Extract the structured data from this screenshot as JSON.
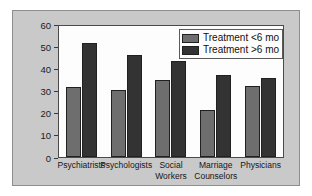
{
  "chart_data": {
    "type": "bar",
    "title": "",
    "subtitle": "",
    "xlabel": "",
    "ylabel": "",
    "ylim": [
      0,
      60
    ],
    "yticks": [
      0,
      10,
      20,
      30,
      40,
      50,
      60
    ],
    "ytick_labels": [
      "0",
      "10",
      "20",
      "30",
      "40",
      "50",
      "60"
    ],
    "grid": false,
    "legend_position": "top-right",
    "categories": [
      "Psychiatrists",
      "Psychologists",
      "Social Workers",
      "Marriage Counselors",
      "Physicians"
    ],
    "category_lines": [
      [
        "Psychiatrists"
      ],
      [
        "Psychologists"
      ],
      [
        "Social",
        "Workers"
      ],
      [
        "Marriage",
        "Counselors"
      ],
      [
        "Physicians"
      ]
    ],
    "series": [
      {
        "name": "Treatment <6 mo",
        "color": "#6e6e6e",
        "values": [
          32,
          30.8,
          35.5,
          21.5,
          32.5
        ]
      },
      {
        "name": "Treatment >6 mo",
        "color": "#333333",
        "values": [
          52.3,
          46.5,
          44.2,
          37.5,
          36
        ]
      }
    ]
  },
  "legend": {
    "items": [
      {
        "label": "Treatment <6 mo"
      },
      {
        "label": "Treatment >6 mo"
      }
    ]
  },
  "colors": {
    "panel_background": "#c9c9c9",
    "plot_background": "#fdfdfd",
    "axis": "#3a3a3a",
    "series_short": "#6e6e6e",
    "series_long": "#333333"
  }
}
